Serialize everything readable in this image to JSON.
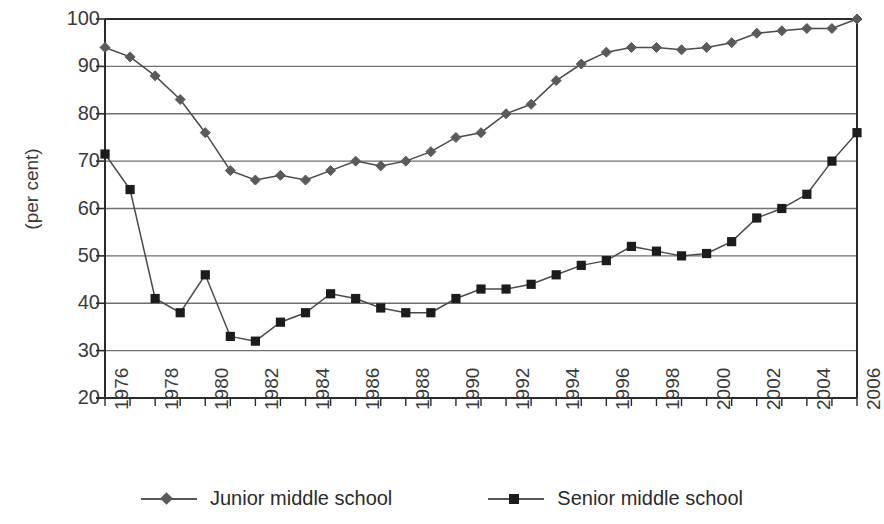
{
  "chart_data": {
    "type": "line",
    "title": "",
    "xlabel": "",
    "ylabel": "(per cent)",
    "ylim": [
      20,
      100
    ],
    "ytick_values": [
      100,
      90,
      80,
      70,
      60,
      50,
      40,
      30,
      20
    ],
    "grid": true,
    "legend_position": "bottom",
    "x": [
      1976,
      1977,
      1978,
      1979,
      1980,
      1981,
      1982,
      1983,
      1984,
      1985,
      1986,
      1987,
      1988,
      1989,
      1990,
      1991,
      1992,
      1993,
      1994,
      1995,
      1996,
      1997,
      1998,
      1999,
      2000,
      2001,
      2002,
      2003,
      2004,
      2005,
      2006
    ],
    "xtick_labels": [
      "1976",
      "1978",
      "1980",
      "1982",
      "1984",
      "1986",
      "1988",
      "1990",
      "1992",
      "1994",
      "1996",
      "1998",
      "2000",
      "2002",
      "2004",
      "2006"
    ],
    "xtick_years": [
      1976,
      1978,
      1980,
      1982,
      1984,
      1986,
      1988,
      1990,
      1992,
      1994,
      1996,
      1998,
      2000,
      2002,
      2004,
      2006
    ],
    "series": [
      {
        "name": "Junior middle school",
        "marker": "diamond",
        "color": "#5a5a5a",
        "values": [
          94,
          92,
          88,
          83,
          76,
          68,
          66,
          67,
          66,
          68,
          70,
          69,
          70,
          72,
          75,
          76,
          80,
          82,
          87,
          90.5,
          93,
          94,
          94,
          93.5,
          94,
          95,
          97,
          97.5,
          98,
          98,
          100
        ]
      },
      {
        "name": "Senior middle school",
        "marker": "square",
        "color": "#1c1c1c",
        "values": [
          71.5,
          64,
          41,
          38,
          46,
          33,
          32,
          36,
          38,
          42,
          41,
          39,
          38,
          38,
          41,
          43,
          43,
          44,
          46,
          48,
          49,
          52,
          51,
          50,
          50.5,
          53,
          58,
          60,
          63,
          70,
          76
        ]
      }
    ]
  },
  "legend": {
    "items": [
      {
        "label": "Junior middle school",
        "marker": "diamond-marker-icon"
      },
      {
        "label": "Senior middle school",
        "marker": "square-marker-icon"
      }
    ]
  },
  "axis": {
    "y_title": "(per cent)"
  }
}
